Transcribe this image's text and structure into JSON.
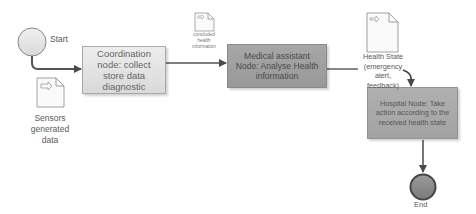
{
  "diagram": {
    "type": "workflow",
    "events": {
      "start": {
        "label": "Start"
      },
      "end": {
        "label": "End"
      }
    },
    "nodes": [
      {
        "id": "coordination",
        "label": "Coordination node: collect store data diagnostic"
      },
      {
        "id": "medical",
        "label": "Medical assistant Node: Analyse Health information"
      },
      {
        "id": "hospital",
        "label": "Hospital Node: Take action according to the received health state"
      }
    ],
    "data_objects": [
      {
        "id": "sensors",
        "label": "Sensors generated data",
        "icon": "document-arrow-icon"
      },
      {
        "id": "concluded",
        "label": "concluded health information",
        "icon": "document-arrow-icon"
      },
      {
        "id": "health_state",
        "label": "Health State (emergency alert, feedback)",
        "icon": "document-arrow-icon"
      }
    ],
    "flows": [
      {
        "from": "start",
        "to": "coordination"
      },
      {
        "from": "coordination",
        "to": "medical"
      },
      {
        "from": "medical",
        "to": "hospital"
      },
      {
        "from": "hospital",
        "to": "end"
      }
    ],
    "colors": {
      "coordination_fill": "#e3e3e3",
      "medical_fill": "#a0a0a0",
      "hospital_fill": "#a9a9a9",
      "event_fill": "#e6e6e6",
      "end_fill": "#8c8c8c",
      "line": "#555555"
    }
  }
}
